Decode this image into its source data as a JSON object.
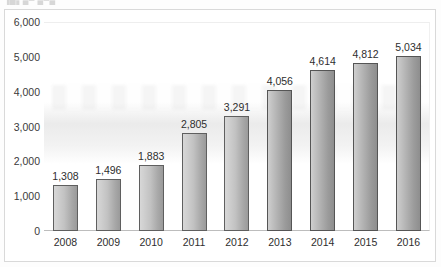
{
  "title_fragment": "▐█▖▄▀ ▄▀▄",
  "chart_data": {
    "type": "bar",
    "title": "",
    "xlabel": "",
    "ylabel": "",
    "categories": [
      "2008",
      "2009",
      "2010",
      "2011",
      "2012",
      "2013",
      "2014",
      "2015",
      "2016"
    ],
    "values": [
      1308,
      1496,
      1883,
      2805,
      3291,
      4056,
      4614,
      4812,
      5034
    ],
    "value_labels": [
      "1,308",
      "1,496",
      "1,883",
      "2,805",
      "3,291",
      "4,056",
      "4,614",
      "4,812",
      "5,034"
    ],
    "ylim": [
      0,
      6000
    ],
    "ytick_values": [
      0,
      1000,
      2000,
      3000,
      4000,
      5000,
      6000
    ],
    "ytick_labels": [
      "0",
      "1,000",
      "2,000",
      "3,000",
      "4,000",
      "5,000",
      "6,000"
    ],
    "grid": false,
    "legend": "none",
    "bar_color": "#b9b9b9",
    "bar_border_color": "#5f5f5f",
    "data_label_color": "#2e2e2e",
    "axis_text_color": "#2e2e2e",
    "frame_color": "#d9d9d9",
    "plot_background": "#ffffff"
  }
}
